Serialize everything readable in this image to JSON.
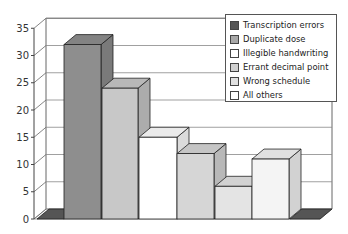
{
  "chart_data": {
    "type": "bar",
    "style": "3d-column",
    "title": "",
    "xlabel": "",
    "ylabel": "",
    "ylim": [
      0,
      35
    ],
    "yticks": [
      0,
      5,
      10,
      15,
      20,
      25,
      30,
      35
    ],
    "grid": true,
    "legend_position": "top-right",
    "categories": [
      "Transcription errors",
      "Duplicate dose",
      "Illegible handwriting",
      "Errant decimal point",
      "Wrong schedule",
      "All others"
    ],
    "bars": [
      {
        "label": "Transcription errors",
        "value": 0,
        "color": "#555555"
      },
      {
        "label": "Duplicate dose",
        "value": 32,
        "color": "#8e8e8e"
      },
      {
        "label": "Illegible handwriting",
        "value": 24,
        "color": "#c8c8c8"
      },
      {
        "label": "Errant decimal point",
        "value": 15,
        "color": "#ffffff"
      },
      {
        "label": "Wrong schedule",
        "value": 12,
        "color": "#d6d6d6"
      },
      {
        "label": "All others",
        "value": 6,
        "color": "#e4e4e4"
      },
      {
        "label": "All others",
        "value": 11,
        "color": "#f4f4f4"
      },
      {
        "label": "Transcription errors",
        "value": 0,
        "color": "#555555"
      }
    ]
  },
  "legend": {
    "items": [
      {
        "label": "Transcription errors",
        "color": "#555555"
      },
      {
        "label": "Duplicate dose",
        "color": "#a8a8a8"
      },
      {
        "label": "Illegible handwriting",
        "color": "#ffffff"
      },
      {
        "label": "Errant decimal point",
        "color": "#d0d0d0"
      },
      {
        "label": "Wrong schedule",
        "color": "#e0e0e0"
      },
      {
        "label": "All others",
        "color": "#ffffff"
      }
    ]
  }
}
